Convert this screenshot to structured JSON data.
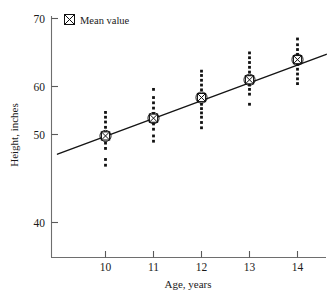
{
  "chart_data": {
    "type": "scatter",
    "title": "",
    "subtitle": "",
    "xlabel": "Age, years",
    "ylabel": "Height, inches",
    "xlim": [
      9.0,
      14.6
    ],
    "ylim": [
      36.0,
      70.6
    ],
    "xticks": [
      10,
      11,
      12,
      13,
      14
    ],
    "xtick_labels": [
      "10",
      "11",
      "12",
      "13",
      "14"
    ],
    "yticks": [
      40,
      50,
      60,
      70
    ],
    "ytick_labels": [
      "40",
      "50",
      "60",
      "70"
    ],
    "grid": false,
    "legend_position": "top-left",
    "legend": [
      {
        "label": "Mean value",
        "marker": "crossed-square"
      }
    ],
    "categories": [
      10,
      11,
      12,
      13,
      14
    ],
    "series": [
      {
        "name": "Individual observations",
        "marker": "dot",
        "points": [
          {
            "x": 10,
            "y": 43.6
          },
          {
            "x": 10,
            "y": 44.8
          },
          {
            "x": 10,
            "y": 47.1
          },
          {
            "x": 10,
            "y": 48.2
          },
          {
            "x": 10,
            "y": 49.3
          },
          {
            "x": 10,
            "y": 50.4
          },
          {
            "x": 10,
            "y": 51.5
          },
          {
            "x": 10,
            "y": 52.6
          },
          {
            "x": 10,
            "y": 53.6
          },
          {
            "x": 10,
            "y": 54.6
          },
          {
            "x": 11,
            "y": 48.6
          },
          {
            "x": 11,
            "y": 49.7
          },
          {
            "x": 11,
            "y": 51.1
          },
          {
            "x": 11,
            "y": 52.2
          },
          {
            "x": 11,
            "y": 53.3
          },
          {
            "x": 11,
            "y": 54.4
          },
          {
            "x": 11,
            "y": 55.5
          },
          {
            "x": 11,
            "y": 56.6
          },
          {
            "x": 11,
            "y": 57.7
          },
          {
            "x": 11,
            "y": 59.4
          },
          {
            "x": 12,
            "y": 51.4
          },
          {
            "x": 12,
            "y": 52.5
          },
          {
            "x": 12,
            "y": 53.6
          },
          {
            "x": 12,
            "y": 54.5
          },
          {
            "x": 12,
            "y": 55.4
          },
          {
            "x": 12,
            "y": 56.3
          },
          {
            "x": 12,
            "y": 57.2
          },
          {
            "x": 12,
            "y": 58.3
          },
          {
            "x": 12,
            "y": 59.3
          },
          {
            "x": 12,
            "y": 60.3
          },
          {
            "x": 12,
            "y": 61.3
          },
          {
            "x": 12,
            "y": 62.3
          },
          {
            "x": 12,
            "y": 63.2
          },
          {
            "x": 13,
            "y": 56.3
          },
          {
            "x": 13,
            "y": 58.4
          },
          {
            "x": 13,
            "y": 59.4
          },
          {
            "x": 13,
            "y": 60.3
          },
          {
            "x": 13,
            "y": 61.2
          },
          {
            "x": 13,
            "y": 62.1
          },
          {
            "x": 13,
            "y": 63.0
          },
          {
            "x": 13,
            "y": 64.0
          },
          {
            "x": 13,
            "y": 65.0
          },
          {
            "x": 13,
            "y": 66.0
          },
          {
            "x": 13,
            "y": 67.0
          },
          {
            "x": 14,
            "y": 60.6
          },
          {
            "x": 14,
            "y": 61.6
          },
          {
            "x": 14,
            "y": 62.6
          },
          {
            "x": 14,
            "y": 63.6
          },
          {
            "x": 14,
            "y": 64.6
          },
          {
            "x": 14,
            "y": 65.6
          },
          {
            "x": 14,
            "y": 66.7
          },
          {
            "x": 14,
            "y": 67.7
          },
          {
            "x": 14,
            "y": 68.7
          },
          {
            "x": 14,
            "y": 69.9
          }
        ]
      },
      {
        "name": "Mean value",
        "marker": "crossed-square",
        "points": [
          {
            "x": 10,
            "y": 49.7
          },
          {
            "x": 11,
            "y": 53.4
          },
          {
            "x": 12,
            "y": 57.7
          },
          {
            "x": 13,
            "y": 61.4
          },
          {
            "x": 14,
            "y": 65.6
          }
        ]
      },
      {
        "name": "Fitted regression line",
        "marker": "line",
        "points": [
          {
            "x": 9.0,
            "y": 45.9
          },
          {
            "x": 14.6,
            "y": 66.7
          }
        ]
      }
    ],
    "colors": {
      "dot": "#111111",
      "line": "#141414",
      "axis": "#6e6e6e",
      "text": "#1a1a1a",
      "background": "#ffffff"
    }
  }
}
